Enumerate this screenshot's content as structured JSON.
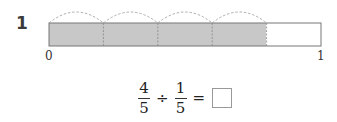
{
  "question": {
    "number": "1"
  },
  "tape_diagram": {
    "parts": 5,
    "shaded_parts": 4,
    "arcs": 4,
    "shade_color": "#c8c8c8",
    "labels": {
      "start": "0",
      "end": "1"
    }
  },
  "equation": {
    "left": {
      "numerator": "4",
      "denominator": "5"
    },
    "operator": "÷",
    "right": {
      "numerator": "1",
      "denominator": "5"
    },
    "equals": "="
  }
}
